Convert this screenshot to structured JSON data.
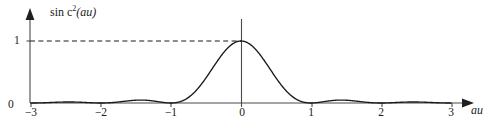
{
  "figure": {
    "name": "sinc-squared-plot",
    "background_color": "#ffffff",
    "curve_color": "#1a1a1a",
    "axis_color": "#4a4a4a"
  },
  "labels": {
    "y_axis_title_prefix": "sin c",
    "y_axis_title_exponent": "2",
    "y_axis_title_arg": "(au)",
    "y_axis_title_full": "sin c2(au)",
    "x_axis_title": "au",
    "y_tick_one": "1",
    "origin": "0"
  },
  "chart_data": {
    "type": "line",
    "title": "",
    "subtitle": "",
    "xlabel": "au",
    "ylabel": "sin c2(au)",
    "function": "sinc^2(au) = (sin(pi*au)/(pi*au))^2",
    "xlim": [
      -3.25,
      3.25
    ],
    "ylim": [
      0,
      1.12
    ],
    "grid": false,
    "legend": null,
    "x_ticks": [
      -3,
      -2,
      -1,
      0,
      1,
      2,
      3
    ],
    "x_tick_labels": [
      "−3",
      "−2",
      "−1",
      "0",
      "1",
      "2",
      "3"
    ],
    "y_ticks": [
      0,
      1
    ],
    "y_tick_labels": [
      "0",
      "1"
    ],
    "annotations": [
      {
        "name": "peak-guide-line",
        "type": "dashed-horizontal",
        "y": 1,
        "x_from": -3.0,
        "x_to": 0
      }
    ],
    "key_points": [
      {
        "x": -3,
        "y": 0,
        "kind": "zero"
      },
      {
        "x": -2.5,
        "y": 0.0162,
        "kind": "sidelobe-peak"
      },
      {
        "x": -2,
        "y": 0,
        "kind": "zero"
      },
      {
        "x": -1.43,
        "y": 0.0472,
        "kind": "sidelobe-peak"
      },
      {
        "x": -1,
        "y": 0,
        "kind": "zero"
      },
      {
        "x": 0,
        "y": 1,
        "kind": "main-peak"
      },
      {
        "x": 1,
        "y": 0,
        "kind": "zero"
      },
      {
        "x": 1.43,
        "y": 0.0472,
        "kind": "sidelobe-peak"
      },
      {
        "x": 2,
        "y": 0,
        "kind": "zero"
      },
      {
        "x": 2.5,
        "y": 0.0162,
        "kind": "sidelobe-peak"
      },
      {
        "x": 3,
        "y": 0,
        "kind": "zero"
      }
    ],
    "series": [
      {
        "name": "sinc^2(au)",
        "x": [
          -3.0,
          -2.9,
          -2.8,
          -2.7,
          -2.6,
          -2.5,
          -2.4,
          -2.3,
          -2.2,
          -2.1,
          -2.0,
          -1.9,
          -1.8,
          -1.7,
          -1.6,
          -1.5,
          -1.4,
          -1.3,
          -1.2,
          -1.1,
          -1.0,
          -0.9,
          -0.8,
          -0.7,
          -0.6,
          -0.5,
          -0.4,
          -0.3,
          -0.2,
          -0.1,
          0.0,
          0.1,
          0.2,
          0.3,
          0.4,
          0.5,
          0.6,
          0.7,
          0.8,
          0.9,
          1.0,
          1.1,
          1.2,
          1.3,
          1.4,
          1.5,
          1.6,
          1.7,
          1.8,
          1.9,
          2.0,
          2.1,
          2.2,
          2.3,
          2.4,
          2.5,
          2.6,
          2.7,
          2.8,
          2.9,
          3.0
        ],
        "y": [
          0.0,
          0.0011,
          0.0041,
          0.0082,
          0.0125,
          0.0162,
          0.0185,
          0.0188,
          0.0169,
          0.0129,
          0.0,
          0.0126,
          0.0254,
          0.0357,
          0.0427,
          0.045,
          0.0429,
          0.0365,
          0.0269,
          0.0153,
          0.0,
          0.0109,
          0.0432,
          0.095,
          0.1625,
          0.4053,
          0.5737,
          0.7368,
          0.8751,
          0.9675,
          1.0,
          0.9675,
          0.8751,
          0.7368,
          0.5737,
          0.4053,
          0.1625,
          0.095,
          0.0432,
          0.0109,
          0.0,
          0.0153,
          0.0269,
          0.0365,
          0.0429,
          0.045,
          0.0427,
          0.0357,
          0.0254,
          0.0126,
          0.0,
          0.0129,
          0.0169,
          0.0188,
          0.0185,
          0.0162,
          0.0125,
          0.0082,
          0.0041,
          0.0011,
          0.0
        ]
      }
    ]
  },
  "geometry": {
    "origin_px": {
      "x": 241,
      "y": 103
    },
    "unit_px_x": 70,
    "peak_y_px": 41,
    "y_axis_x_px": 30,
    "y_axis_top_px": 10,
    "x_axis_right_px": 470
  }
}
